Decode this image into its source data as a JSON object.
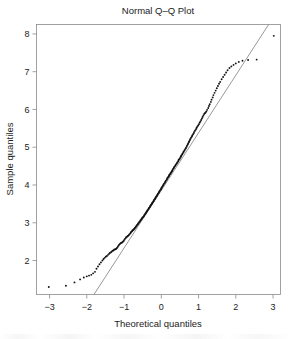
{
  "chart_data": {
    "type": "scatter",
    "title": "Normal Q–Q Plot",
    "xlabel": "Theoretical quantiles",
    "ylabel": "Sample quantiles",
    "xlim": [
      -3.35,
      3.2
    ],
    "ylim": [
      1.1,
      8.25
    ],
    "xticks": [
      -3,
      -2,
      -1,
      0,
      1,
      2,
      3
    ],
    "xtick_labels": [
      "−3",
      "−2",
      "−1",
      "0",
      "1",
      "2",
      "3"
    ],
    "yticks": [
      2,
      3,
      4,
      5,
      6,
      7,
      8
    ],
    "ytick_labels": [
      "2",
      "3",
      "4",
      "5",
      "6",
      "7",
      "8"
    ],
    "grid": false,
    "legend": false,
    "point_color": "#121212",
    "line_color": "#7d7d7d",
    "border_color": "#8a8a8a",
    "reference_line": {
      "name": "qqline",
      "slope": 1.525,
      "intercept": 3.856,
      "x_at_bottom_edge": -1.31,
      "y_at_right_edge": 6.9
    },
    "series": [
      {
        "name": "Sample quantiles",
        "x": [
          -3.02,
          -2.56,
          -2.33,
          -2.18,
          -2.08,
          -2.0,
          -1.94,
          -1.88,
          -1.83,
          -1.78,
          -1.74,
          -1.7,
          -1.66,
          -1.62,
          -1.58,
          -1.55,
          -1.52,
          -1.49,
          -1.46,
          -1.43,
          -1.4,
          -1.38,
          -1.35,
          -1.33,
          -1.3,
          -1.28,
          -1.26,
          -1.23,
          -1.21,
          -1.19,
          -1.17,
          -1.15,
          -1.13,
          -1.11,
          -1.09,
          -1.07,
          -1.05,
          -1.03,
          -1.01,
          -0.99,
          -0.97,
          -0.95,
          -0.94,
          -0.92,
          -0.9,
          -0.88,
          -0.87,
          -0.85,
          -0.83,
          -0.82,
          -0.8,
          -0.78,
          -0.77,
          -0.75,
          -0.74,
          -0.72,
          -0.71,
          -0.69,
          -0.68,
          -0.66,
          -0.65,
          -0.63,
          -0.62,
          -0.6,
          -0.59,
          -0.57,
          -0.56,
          -0.54,
          -0.53,
          -0.52,
          -0.5,
          -0.49,
          -0.47,
          -0.46,
          -0.45,
          -0.43,
          -0.42,
          -0.41,
          -0.39,
          -0.38,
          -0.37,
          -0.35,
          -0.34,
          -0.33,
          -0.31,
          -0.3,
          -0.29,
          -0.28,
          -0.26,
          -0.25,
          -0.24,
          -0.22,
          -0.21,
          -0.2,
          -0.19,
          -0.17,
          -0.16,
          -0.15,
          -0.14,
          -0.12,
          -0.11,
          -0.1,
          -0.09,
          -0.07,
          -0.06,
          -0.05,
          -0.04,
          -0.02,
          -0.01,
          0.0,
          0.01,
          0.02,
          0.04,
          0.05,
          0.06,
          0.07,
          0.09,
          0.1,
          0.11,
          0.12,
          0.14,
          0.15,
          0.16,
          0.17,
          0.19,
          0.2,
          0.21,
          0.22,
          0.24,
          0.25,
          0.26,
          0.28,
          0.29,
          0.3,
          0.31,
          0.33,
          0.34,
          0.35,
          0.37,
          0.38,
          0.39,
          0.41,
          0.42,
          0.43,
          0.45,
          0.46,
          0.47,
          0.49,
          0.5,
          0.52,
          0.53,
          0.54,
          0.56,
          0.57,
          0.59,
          0.6,
          0.62,
          0.63,
          0.65,
          0.66,
          0.68,
          0.69,
          0.71,
          0.72,
          0.74,
          0.75,
          0.77,
          0.78,
          0.8,
          0.82,
          0.83,
          0.85,
          0.87,
          0.88,
          0.9,
          0.92,
          0.94,
          0.95,
          0.97,
          0.99,
          1.01,
          1.03,
          1.05,
          1.07,
          1.09,
          1.11,
          1.13,
          1.15,
          1.17,
          1.19,
          1.21,
          1.23,
          1.26,
          1.28,
          1.3,
          1.33,
          1.35,
          1.38,
          1.4,
          1.43,
          1.46,
          1.49,
          1.52,
          1.55,
          1.58,
          1.62,
          1.66,
          1.7,
          1.74,
          1.78,
          1.83,
          1.88,
          1.94,
          2.0,
          2.08,
          2.18,
          2.33,
          2.56,
          3.02
        ],
        "y": [
          1.3,
          1.33,
          1.42,
          1.5,
          1.55,
          1.58,
          1.6,
          1.62,
          1.66,
          1.7,
          1.78,
          1.84,
          1.9,
          1.95,
          2.0,
          2.04,
          2.07,
          2.1,
          2.12,
          2.15,
          2.18,
          2.2,
          2.22,
          2.24,
          2.26,
          2.27,
          2.29,
          2.3,
          2.31,
          2.33,
          2.36,
          2.39,
          2.42,
          2.44,
          2.46,
          2.47,
          2.48,
          2.5,
          2.52,
          2.55,
          2.58,
          2.6,
          2.62,
          2.63,
          2.65,
          2.66,
          2.68,
          2.7,
          2.72,
          2.74,
          2.76,
          2.78,
          2.8,
          2.81,
          2.83,
          2.84,
          2.86,
          2.88,
          2.9,
          2.92,
          2.94,
          2.96,
          2.98,
          3.0,
          3.02,
          3.04,
          3.06,
          3.08,
          3.1,
          3.12,
          3.14,
          3.15,
          3.17,
          3.19,
          3.21,
          3.23,
          3.25,
          3.27,
          3.29,
          3.31,
          3.33,
          3.35,
          3.37,
          3.39,
          3.41,
          3.43,
          3.45,
          3.47,
          3.49,
          3.51,
          3.53,
          3.55,
          3.57,
          3.59,
          3.61,
          3.63,
          3.65,
          3.67,
          3.69,
          3.71,
          3.73,
          3.75,
          3.77,
          3.79,
          3.81,
          3.83,
          3.85,
          3.87,
          3.89,
          3.91,
          3.93,
          3.95,
          3.97,
          3.99,
          4.01,
          4.03,
          4.05,
          4.07,
          4.09,
          4.11,
          4.13,
          4.15,
          4.17,
          4.19,
          4.21,
          4.23,
          4.25,
          4.27,
          4.29,
          4.31,
          4.33,
          4.35,
          4.37,
          4.39,
          4.42,
          4.44,
          4.46,
          4.48,
          4.5,
          4.52,
          4.54,
          4.56,
          4.58,
          4.6,
          4.62,
          4.65,
          4.67,
          4.69,
          4.71,
          4.74,
          4.76,
          4.78,
          4.81,
          4.83,
          4.86,
          4.88,
          4.91,
          4.93,
          4.96,
          4.98,
          5.01,
          5.04,
          5.07,
          5.1,
          5.13,
          5.16,
          5.19,
          5.22,
          5.25,
          5.28,
          5.31,
          5.34,
          5.37,
          5.4,
          5.43,
          5.46,
          5.49,
          5.52,
          5.55,
          5.58,
          5.61,
          5.65,
          5.68,
          5.72,
          5.76,
          5.8,
          5.84,
          5.88,
          5.9,
          5.92,
          5.95,
          5.99,
          6.04,
          6.09,
          6.14,
          6.2,
          6.26,
          6.32,
          6.38,
          6.44,
          6.5,
          6.56,
          6.62,
          6.68,
          6.73,
          6.8,
          6.86,
          6.92,
          6.98,
          7.04,
          7.1,
          7.14,
          7.18,
          7.22,
          7.26,
          7.29,
          7.31,
          7.32,
          7.95
        ]
      }
    ]
  }
}
